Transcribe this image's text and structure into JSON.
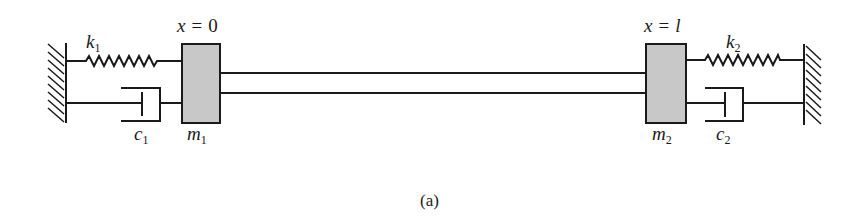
{
  "figure": {
    "caption": "(a)",
    "left_position_label": {
      "var": "x",
      "eq": "=",
      "value": "0"
    },
    "right_position_label": {
      "var": "x",
      "eq": "=",
      "value": "l"
    },
    "left_spring": {
      "symbol": "k",
      "sub": "1"
    },
    "right_spring": {
      "symbol": "k",
      "sub": "2"
    },
    "left_damper": {
      "symbol": "c",
      "sub": "1"
    },
    "right_damper": {
      "symbol": "c",
      "sub": "2"
    },
    "left_mass": {
      "symbol": "m",
      "sub": "1"
    },
    "right_mass": {
      "symbol": "m",
      "sub": "2"
    },
    "colors": {
      "stroke": "#1a1a1a",
      "mass_fill": "#c8c8c8",
      "background": "#ffffff"
    }
  }
}
